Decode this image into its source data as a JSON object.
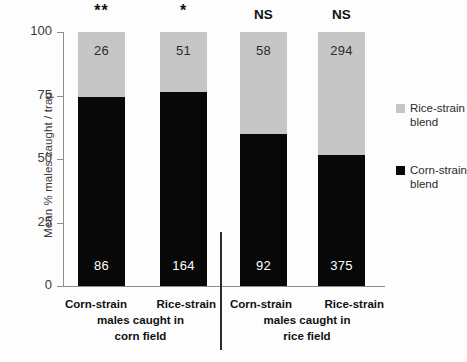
{
  "chart_data": {
    "type": "bar",
    "subtype": "stacked-percentage",
    "title": "",
    "xlabel": "",
    "ylabel": "Mean % males caught / trap",
    "ylim": [
      0,
      100
    ],
    "yticks": [
      0,
      25,
      50,
      75,
      100
    ],
    "ytick_labels": [
      "0",
      "25",
      "50",
      "75",
      "100"
    ],
    "grid": false,
    "legend_position": "right",
    "categories": [
      "Corn-strain",
      "Rice-strain",
      "Corn-strain",
      "Rice-strain"
    ],
    "groups": [
      {
        "label_line1": "males caught in",
        "label_line2": "corn field",
        "members": [
          "Corn-strain",
          "Rice-strain"
        ]
      },
      {
        "label_line1": "males caught in",
        "label_line2": "rice field",
        "members": [
          "Corn-strain",
          "Rice-strain"
        ]
      }
    ],
    "series": [
      {
        "name": "Corn-strain blend",
        "color": "#080808",
        "values": [
          74.5,
          76.5,
          60.0,
          51.5
        ],
        "counts": [
          86,
          164,
          92,
          375
        ]
      },
      {
        "name": "Rice-strain blend",
        "color": "#c6c6c6",
        "values": [
          25.5,
          23.5,
          40.0,
          48.5
        ],
        "counts": [
          26,
          51,
          58,
          294
        ]
      }
    ],
    "significance": [
      "**",
      "*",
      "NS",
      "NS"
    ],
    "annotations": [
      {
        "bar": 0,
        "segment": "Rice-strain blend",
        "text": "26"
      },
      {
        "bar": 0,
        "segment": "Corn-strain blend",
        "text": "86"
      },
      {
        "bar": 1,
        "segment": "Rice-strain blend",
        "text": "51"
      },
      {
        "bar": 1,
        "segment": "Corn-strain blend",
        "text": "164"
      },
      {
        "bar": 2,
        "segment": "Rice-strain blend",
        "text": "58"
      },
      {
        "bar": 2,
        "segment": "Corn-strain blend",
        "text": "92"
      },
      {
        "bar": 3,
        "segment": "Rice-strain blend",
        "text": "294"
      },
      {
        "bar": 3,
        "segment": "Corn-strain blend",
        "text": "375"
      }
    ]
  },
  "axis": {
    "ylabel": "Mean % males caught / trap",
    "tick_100": "100",
    "tick_75": "75",
    "tick_50": "50",
    "tick_25": "25",
    "tick_0": "0"
  },
  "bars": [
    {
      "sig": "**",
      "top_value": "26",
      "bottom_value": "86",
      "name": "Corn-strain"
    },
    {
      "sig": "*",
      "top_value": "51",
      "bottom_value": "164",
      "name": "Rice-strain"
    },
    {
      "sig": "NS",
      "top_value": "58",
      "bottom_value": "92",
      "name": "Corn-strain"
    },
    {
      "sig": "NS",
      "top_value": "294",
      "bottom_value": "375",
      "name": "Rice-strain"
    }
  ],
  "captions": {
    "group1": {
      "left": "Corn-strain",
      "right": "Rice-strain",
      "line2": "males caught in",
      "line3": "corn field"
    },
    "group2": {
      "left": "Corn-strain",
      "right": "Rice-strain",
      "line2": "males caught in",
      "line3": "rice field"
    }
  },
  "legend": {
    "entries": [
      {
        "label_line1": "Rice-strain",
        "label_line2": "blend",
        "color": "#c6c6c6"
      },
      {
        "label_line1": "Corn-strain",
        "label_line2": "blend",
        "color": "#080808"
      }
    ]
  }
}
